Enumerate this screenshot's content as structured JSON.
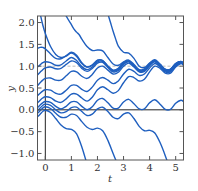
{
  "chart_data": {
    "type": "line",
    "title": "",
    "xlabel": "t",
    "ylabel": "y",
    "xlim": [
      -0.3,
      5.3
    ],
    "ylim": [
      -1.15,
      2.15
    ],
    "xticks": [
      0,
      1,
      2,
      3,
      4,
      5
    ],
    "xtick_labels": [
      "0",
      "1",
      "2",
      "3",
      "4",
      "5"
    ],
    "yticks": [
      -1.0,
      -0.5,
      0.0,
      0.5,
      1.0,
      1.5,
      2.0
    ],
    "ytick_labels": [
      "−1.0",
      "−0.5",
      "0.0",
      "0.5",
      "1.0",
      "1.5",
      "2.0"
    ],
    "grid": false,
    "legend": null,
    "reference_lines": [
      {
        "orientation": "horizontal",
        "y": 0.0,
        "style": "solid",
        "color": "#222222"
      },
      {
        "orientation": "vertical",
        "x": 0.0,
        "style": "solid",
        "color": "#222222"
      },
      {
        "orientation": "horizontal",
        "y": 1.0,
        "style": "dashed",
        "color": "#aaaaaa"
      }
    ],
    "line_color": "#1f5fbf",
    "series": [
      {
        "name": "solution-1",
        "x": [
          -0.3,
          -0.2,
          -0.1,
          0.0,
          0.2,
          0.4,
          0.6,
          0.8,
          1.0,
          1.2,
          1.4,
          1.6,
          1.8,
          2.0,
          2.2,
          2.4,
          2.6,
          2.8,
          3.0,
          3.2,
          3.4,
          3.6,
          3.8,
          4.0,
          4.2,
          4.4,
          4.6,
          4.8,
          5.0,
          5.2,
          5.3
        ],
        "y": [
          2.4,
          2.2,
          1.95,
          1.75,
          1.45,
          1.27,
          1.2,
          1.23,
          1.3,
          1.22,
          1.06,
          0.98,
          1.03,
          1.14,
          1.13,
          1.0,
          0.91,
          0.95,
          1.08,
          1.12,
          1.01,
          0.91,
          0.93,
          1.06,
          1.13,
          1.03,
          0.92,
          0.93,
          1.06,
          1.1,
          1.05
        ]
      },
      {
        "name": "solution-2",
        "x": [
          -0.3,
          -0.2,
          -0.1,
          0.0,
          0.2,
          0.4,
          0.6,
          0.8,
          1.0,
          1.2,
          1.4,
          1.6,
          1.8,
          2.0,
          2.2,
          2.4,
          2.6,
          2.8,
          3.0,
          3.2,
          3.4,
          3.6,
          3.8,
          4.0,
          4.2,
          4.4,
          4.6,
          4.8,
          5.0,
          5.2,
          5.3
        ],
        "y": [
          1.41,
          1.43,
          1.43,
          1.4,
          1.28,
          1.18,
          1.17,
          1.24,
          1.32,
          1.25,
          1.08,
          0.98,
          1.02,
          1.13,
          1.13,
          1.0,
          0.9,
          0.94,
          1.07,
          1.12,
          1.02,
          0.91,
          0.92,
          1.05,
          1.13,
          1.03,
          0.92,
          0.92,
          1.05,
          1.11,
          1.06
        ]
      },
      {
        "name": "solution-3",
        "x": [
          -0.3,
          -0.2,
          -0.1,
          0.0,
          0.2,
          0.4,
          0.6,
          0.8,
          1.0,
          1.2,
          1.4,
          1.6,
          1.8,
          2.0,
          2.2,
          2.4,
          2.6,
          2.8,
          3.0,
          3.2,
          3.4,
          3.6,
          3.8,
          4.0,
          4.2,
          4.4,
          4.6,
          4.8,
          5.0,
          5.2,
          5.3
        ],
        "y": [
          0.98,
          1.03,
          1.08,
          1.1,
          1.08,
          1.02,
          1.03,
          1.12,
          1.2,
          1.13,
          0.99,
          0.92,
          0.98,
          1.1,
          1.11,
          0.99,
          0.89,
          0.92,
          1.06,
          1.11,
          1.01,
          0.9,
          0.91,
          1.04,
          1.12,
          1.02,
          0.91,
          0.91,
          1.04,
          1.1,
          1.06
        ]
      },
      {
        "name": "solution-4",
        "x": [
          -0.3,
          -0.2,
          -0.1,
          0.0,
          0.2,
          0.4,
          0.6,
          0.8,
          1.0,
          1.2,
          1.4,
          1.6,
          1.8,
          2.0,
          2.2,
          2.4,
          2.6,
          2.8,
          3.0,
          3.2,
          3.4,
          3.6,
          3.8,
          4.0,
          4.2,
          4.4,
          4.6,
          4.8,
          5.0,
          5.2,
          5.3
        ],
        "y": [
          0.8,
          0.86,
          0.92,
          0.96,
          0.98,
          0.94,
          0.95,
          1.04,
          1.12,
          1.08,
          0.95,
          0.88,
          0.95,
          1.07,
          1.09,
          0.97,
          0.87,
          0.9,
          1.04,
          1.1,
          1.0,
          0.89,
          0.9,
          1.03,
          1.11,
          1.01,
          0.9,
          0.9,
          1.03,
          1.09,
          1.05
        ]
      },
      {
        "name": "solution-5",
        "x": [
          -0.3,
          -0.2,
          -0.1,
          0.0,
          0.2,
          0.4,
          0.6,
          0.8,
          1.0,
          1.2,
          1.4,
          1.6,
          1.8,
          2.0,
          2.2,
          2.4,
          2.6,
          2.8,
          3.0,
          3.2,
          3.4,
          3.6,
          3.8,
          4.0,
          4.2,
          4.4,
          4.6,
          4.8,
          5.0,
          5.2,
          5.3
        ],
        "y": [
          0.55,
          0.62,
          0.68,
          0.72,
          0.73,
          0.68,
          0.68,
          0.78,
          0.88,
          0.87,
          0.77,
          0.72,
          0.81,
          0.96,
          1.0,
          0.91,
          0.82,
          0.86,
          1.0,
          1.07,
          0.98,
          0.87,
          0.88,
          1.01,
          1.1,
          1.0,
          0.89,
          0.89,
          1.02,
          1.08,
          1.04
        ]
      },
      {
        "name": "solution-6",
        "x": [
          -0.3,
          -0.2,
          -0.1,
          0.0,
          0.2,
          0.4,
          0.6,
          0.8,
          1.0,
          1.2,
          1.4,
          1.6,
          1.8,
          2.0,
          2.2,
          2.4,
          2.6,
          2.8,
          3.0,
          3.2,
          3.4,
          3.6,
          3.8,
          4.0,
          4.2,
          4.4,
          4.6,
          4.8,
          5.0,
          5.2,
          5.3
        ],
        "y": [
          0.32,
          0.38,
          0.43,
          0.46,
          0.45,
          0.38,
          0.36,
          0.45,
          0.56,
          0.56,
          0.47,
          0.42,
          0.52,
          0.68,
          0.74,
          0.68,
          0.6,
          0.66,
          0.82,
          0.93,
          0.88,
          0.79,
          0.82,
          0.96,
          1.06,
          0.98,
          0.87,
          0.87,
          1.0,
          1.07,
          1.03
        ]
      },
      {
        "name": "solution-7",
        "x": [
          -0.3,
          -0.2,
          -0.1,
          0.0,
          0.2,
          0.4,
          0.6,
          0.8,
          1.0,
          1.2,
          1.4,
          1.6,
          1.8,
          2.0,
          2.2,
          2.4,
          2.6,
          2.8,
          3.0,
          3.2,
          3.4,
          3.6,
          3.8,
          4.0,
          4.2,
          4.4,
          4.6,
          4.8,
          5.0,
          5.2,
          5.3
        ],
        "y": [
          0.16,
          0.22,
          0.27,
          0.3,
          0.28,
          0.2,
          0.17,
          0.25,
          0.36,
          0.36,
          0.27,
          0.2,
          0.29,
          0.46,
          0.53,
          0.46,
          0.38,
          0.44,
          0.62,
          0.76,
          0.74,
          0.66,
          0.7,
          0.87,
          1.0,
          0.95,
          0.84,
          0.84,
          0.98,
          1.06,
          1.02
        ]
      },
      {
        "name": "solution-8",
        "x": [
          -0.3,
          -0.2,
          -0.1,
          0.0,
          0.2,
          0.4,
          0.6,
          0.8,
          1.0,
          1.2,
          1.4,
          1.6,
          1.8,
          2.0,
          2.2,
          2.4,
          2.6,
          2.8,
          3.0,
          3.2,
          3.4,
          3.6,
          3.8,
          4.0,
          4.2,
          4.4,
          4.6,
          4.8,
          5.0,
          5.2,
          5.3
        ],
        "y": [
          0.05,
          0.11,
          0.16,
          0.19,
          0.17,
          0.08,
          0.02,
          0.08,
          0.18,
          0.18,
          0.08,
          0.0,
          0.07,
          0.22,
          0.26,
          0.16,
          0.04,
          0.04,
          0.18,
          0.24,
          0.14,
          0.02,
          0.02,
          0.16,
          0.23,
          0.13,
          0.01,
          0.01,
          0.15,
          0.22,
          0.19
        ]
      },
      {
        "name": "solution-9",
        "x": [
          -0.3,
          -0.2,
          -0.1,
          0.0,
          0.2,
          0.4,
          0.6,
          0.8,
          1.0,
          1.2,
          1.4,
          1.6,
          1.8,
          2.0,
          2.2,
          2.4,
          2.6,
          2.8,
          3.0,
          3.2,
          3.4,
          3.6,
          3.8,
          4.0,
          4.2,
          4.4,
          4.6,
          4.8,
          5.0,
          5.2,
          5.3
        ],
        "y": [
          -0.02,
          0.04,
          0.1,
          0.13,
          0.1,
          0.0,
          -0.07,
          -0.04,
          0.05,
          0.06,
          -0.04,
          -0.13,
          -0.1,
          0.02,
          0.06,
          -0.04,
          -0.17,
          -0.2,
          -0.1,
          -0.07,
          -0.2,
          -0.38,
          -0.48,
          -0.47,
          -0.53,
          -0.75,
          -1.05,
          -1.4,
          -1.8,
          -2.2,
          -2.4
        ]
      },
      {
        "name": "solution-10",
        "x": [
          -0.3,
          -0.2,
          -0.1,
          0.0,
          0.2,
          0.4,
          0.6,
          0.8,
          1.0,
          1.2,
          1.4,
          1.6,
          1.8,
          2.0,
          2.2,
          2.4,
          2.6,
          2.8,
          3.0,
          3.2,
          3.4,
          3.6,
          3.8
        ],
        "y": [
          -0.08,
          -0.02,
          0.04,
          0.07,
          0.03,
          -0.08,
          -0.17,
          -0.17,
          -0.1,
          -0.13,
          -0.27,
          -0.4,
          -0.45,
          -0.42,
          -0.48,
          -0.7,
          -1.0,
          -1.3,
          -1.65,
          -2.0,
          -2.3,
          -2.6,
          -2.9
        ]
      },
      {
        "name": "solution-11",
        "x": [
          -0.3,
          -0.2,
          -0.1,
          0.0,
          0.2,
          0.4,
          0.6,
          0.8,
          1.0,
          1.2,
          1.4,
          1.6,
          1.8,
          2.0
        ],
        "y": [
          -0.16,
          -0.1,
          -0.04,
          -0.01,
          -0.06,
          -0.2,
          -0.35,
          -0.43,
          -0.45,
          -0.55,
          -0.85,
          -1.25,
          -1.7,
          -2.2
        ]
      },
      {
        "name": "solution-12",
        "x": [
          0.6,
          0.8,
          1.0,
          1.1,
          1.2,
          1.3,
          1.4,
          1.6,
          1.8,
          2.0,
          2.2,
          2.4,
          2.6,
          2.8,
          3.0,
          3.2,
          3.4,
          3.6,
          3.8,
          4.0,
          4.2,
          4.4,
          4.6,
          4.8,
          5.0,
          5.2,
          5.3
        ],
        "y": [
          2.4,
          2.15,
          1.95,
          1.85,
          1.78,
          1.72,
          1.62,
          1.45,
          1.36,
          1.37,
          1.35,
          1.2,
          1.05,
          1.02,
          1.1,
          1.14,
          1.04,
          0.92,
          0.93,
          1.05,
          1.13,
          1.03,
          0.92,
          0.92,
          1.05,
          1.1,
          1.05
        ]
      },
      {
        "name": "solution-13",
        "x": [
          2.3,
          2.4,
          2.5,
          2.6,
          2.7,
          2.8,
          3.0,
          3.2,
          3.4,
          3.6,
          3.8,
          4.0,
          4.2,
          4.4,
          4.6,
          4.8,
          5.0,
          5.2,
          5.3
        ],
        "y": [
          2.4,
          2.2,
          2.0,
          1.8,
          1.62,
          1.46,
          1.32,
          1.3,
          1.18,
          1.0,
          0.97,
          1.07,
          1.15,
          1.05,
          0.93,
          0.93,
          1.06,
          1.11,
          1.06
        ]
      }
    ]
  }
}
